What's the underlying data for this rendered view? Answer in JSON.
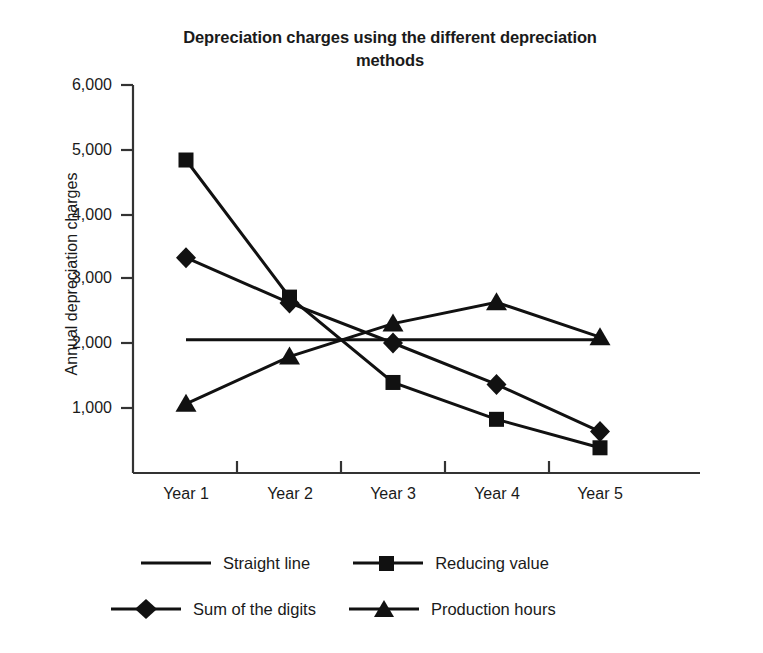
{
  "chart_data": {
    "type": "line",
    "title": "Depreciation charges using the different depreciation methods",
    "xlabel": "",
    "ylabel": "Annual depreciation charges",
    "categories": [
      "Year 1",
      "Year 2",
      "Year 3",
      "Year 4",
      "Year 5"
    ],
    "ylim": [
      0,
      6000
    ],
    "ytick_labels": [
      "6,000",
      "5,000",
      "4,000",
      "3,000",
      "2,000",
      "1,000"
    ],
    "ytick_values": [
      6000,
      5000,
      4000,
      3000,
      2000,
      1000
    ],
    "grid": false,
    "legend_position": "bottom",
    "series": [
      {
        "name": "Straight line",
        "marker": "none",
        "values": [
          2060,
          2060,
          2060,
          2060,
          2060
        ]
      },
      {
        "name": "Reducing value",
        "marker": "square",
        "values": [
          4840,
          2720,
          1400,
          830,
          390
        ]
      },
      {
        "name": "Sum of the digits",
        "marker": "diamond",
        "values": [
          3330,
          2630,
          2010,
          1370,
          640
        ]
      },
      {
        "name": "Production hours",
        "marker": "triangle",
        "values": [
          1070,
          1800,
          2310,
          2640,
          2100
        ]
      }
    ],
    "colors": {
      "line": "#111111",
      "axis": "#333333",
      "text": "#1a1a1a",
      "background": "#ffffff"
    }
  }
}
